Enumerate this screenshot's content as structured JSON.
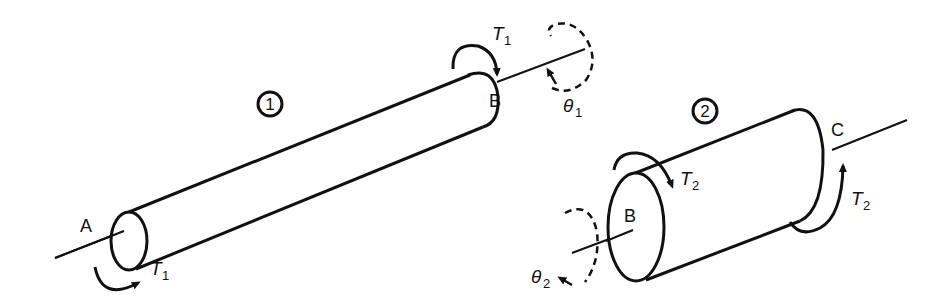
{
  "diagram": {
    "shaft1": {
      "id_label": "1",
      "end_a_label": "A",
      "end_b_label": "B",
      "torque_label": "T",
      "torque_sub": "1",
      "angle_label": "θ",
      "angle_sub": "1"
    },
    "shaft2": {
      "id_label": "2",
      "end_b_label": "B",
      "end_c_label": "C",
      "torque_label": "T",
      "torque_sub": "2",
      "angle_label": "θ",
      "angle_sub": "2"
    },
    "colors": {
      "stroke": "#111111",
      "background": "#ffffff"
    }
  }
}
